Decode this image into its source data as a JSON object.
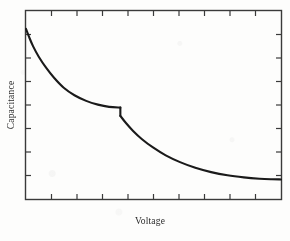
{
  "figure": {
    "name": "capacitance-voltage-plot",
    "background_color": "#fdfdfc",
    "line_color": "#1a1a1a",
    "axis_color": "#3a3a3a"
  },
  "chart_data": {
    "type": "line",
    "title": "",
    "subtitle": "",
    "xlabel": "Voltage",
    "ylabel": "Capacitance",
    "xlim": [
      0,
      1
    ],
    "ylim": [
      0,
      1
    ],
    "grid": false,
    "legend": null,
    "axis_tick_labels": {
      "x": [],
      "y": []
    },
    "ticks": {
      "direction": "in",
      "x_count_interior": 9,
      "y_count_interior": 7,
      "top_axis_ticks": true,
      "right_axis_ticks": true
    },
    "annotations": [
      {
        "name": "discontinuity",
        "description": "abrupt downward step in capacitance",
        "x": 0.37
      }
    ],
    "series": [
      {
        "name": "branch-1",
        "description": "high-capacitance branch decaying to plateau before the step",
        "x": [
          0.0,
          0.012,
          0.028,
          0.05,
          0.078,
          0.11,
          0.148,
          0.19,
          0.236,
          0.282,
          0.326,
          0.37
        ],
        "y": [
          0.905,
          0.862,
          0.812,
          0.757,
          0.7,
          0.645,
          0.592,
          0.552,
          0.522,
          0.502,
          0.49,
          0.486
        ]
      },
      {
        "name": "step",
        "description": "vertical discontinuity at the transition voltage",
        "x": [
          0.37,
          0.37
        ],
        "y": [
          0.486,
          0.442
        ]
      },
      {
        "name": "branch-2",
        "description": "low-capacitance branch decaying to a flat asymptote",
        "x": [
          0.37,
          0.392,
          0.42,
          0.455,
          0.498,
          0.548,
          0.604,
          0.664,
          0.726,
          0.79,
          0.854,
          0.916,
          0.964,
          1.0
        ],
        "y": [
          0.442,
          0.404,
          0.362,
          0.318,
          0.274,
          0.232,
          0.196,
          0.166,
          0.143,
          0.126,
          0.115,
          0.108,
          0.105,
          0.104
        ]
      }
    ]
  }
}
